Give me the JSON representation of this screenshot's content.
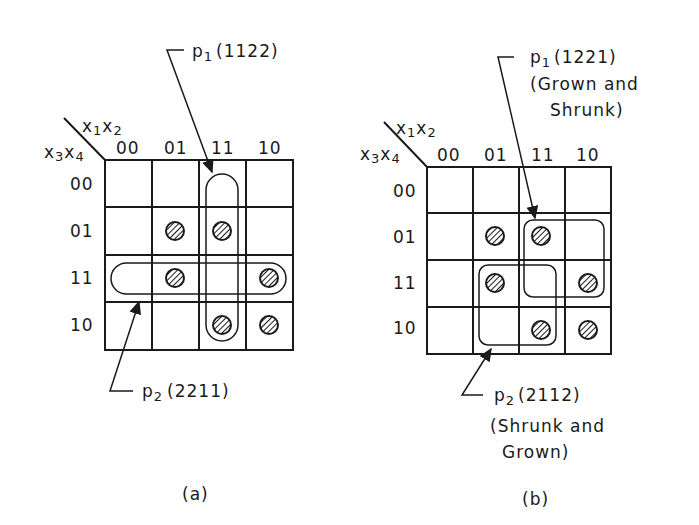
{
  "diagram_a": {
    "caption": "(a)",
    "axis_top": "x1 x2",
    "axis_left": "x3 x4",
    "col_headers": [
      "00",
      "01",
      "11",
      "10"
    ],
    "row_headers": [
      "00",
      "01",
      "11",
      "10"
    ],
    "marked_cells": [
      [
        1,
        1
      ],
      [
        1,
        2
      ],
      [
        2,
        1
      ],
      [
        2,
        3
      ],
      [
        3,
        2
      ],
      [
        3,
        3
      ]
    ],
    "p1": {
      "name": "p",
      "sub": "1",
      "code": "(1122)"
    },
    "p2": {
      "name": "p",
      "sub": "2",
      "code": "(2211)"
    }
  },
  "diagram_b": {
    "caption": "(b)",
    "axis_top": "x1 x2",
    "axis_left": "x3 x4",
    "col_headers": [
      "00",
      "01",
      "11",
      "10"
    ],
    "row_headers": [
      "00",
      "01",
      "11",
      "10"
    ],
    "marked_cells": [
      [
        1,
        1
      ],
      [
        1,
        2
      ],
      [
        2,
        1
      ],
      [
        2,
        3
      ],
      [
        3,
        2
      ],
      [
        3,
        3
      ]
    ],
    "p1": {
      "name": "p",
      "sub": "1",
      "code": "(1221)",
      "note1": "(Grown and",
      "note2": "Shrunk)"
    },
    "p2": {
      "name": "p",
      "sub": "2",
      "code": "(2112)",
      "note1": "(Shrunk and",
      "note2": "Grown)"
    }
  },
  "colors": {
    "ink": "#1a1a1a",
    "background": "#ffffff"
  }
}
